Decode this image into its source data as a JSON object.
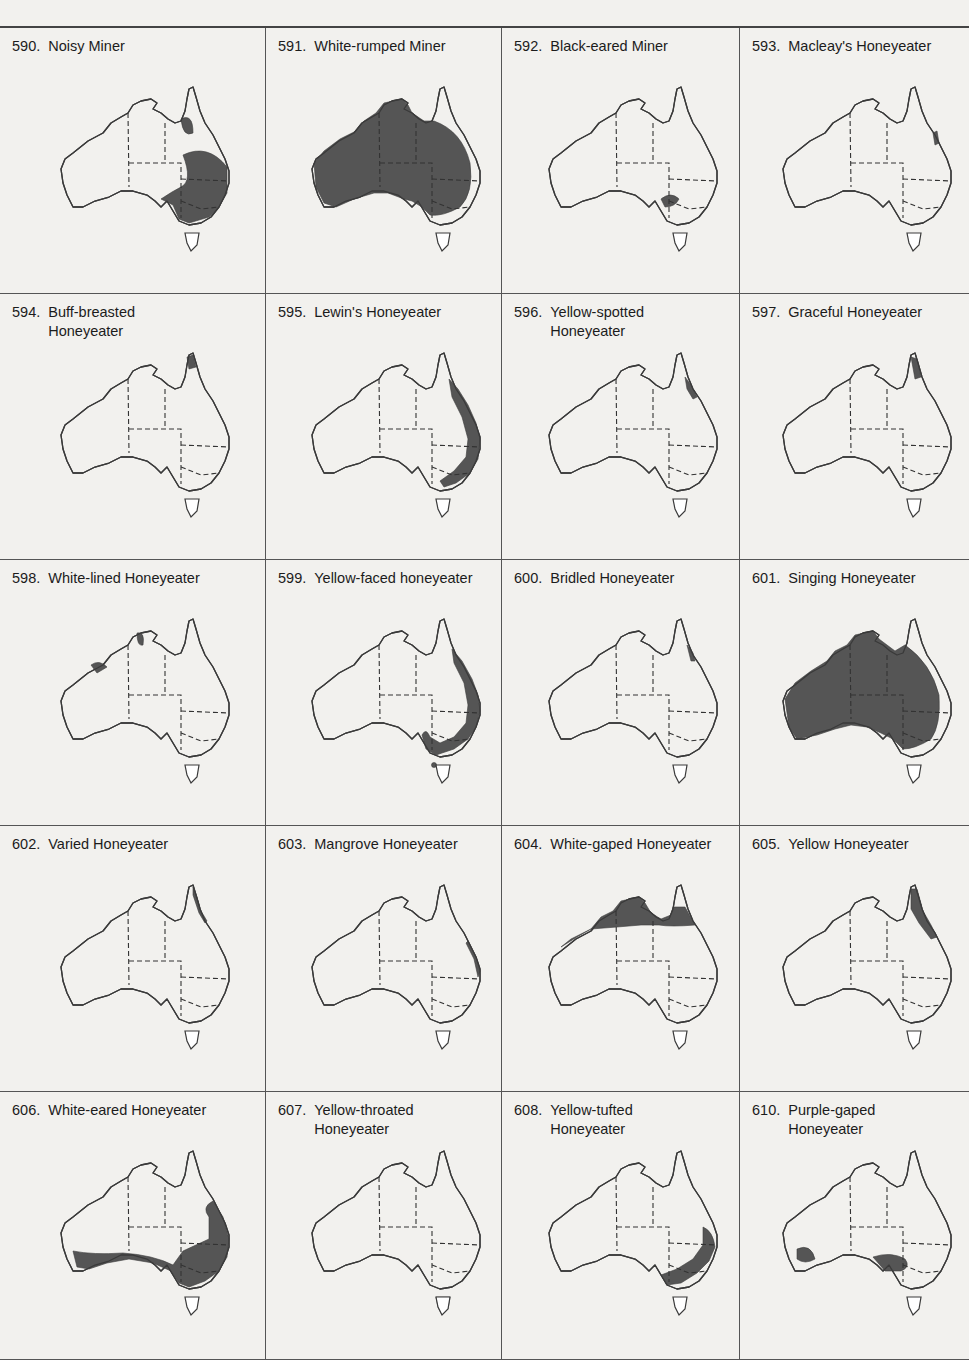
{
  "page": {
    "columns": 4,
    "rows": 5,
    "range_fill_color": "#555555",
    "outline_color": "#3a3a3a",
    "background_color": "#f2f1ee"
  },
  "maps": [
    {
      "number": "590.",
      "name": "Noisy Miner",
      "range": "eastern Australia from Cape York to SE South Australia, plus Tasmania"
    },
    {
      "number": "591.",
      "name": "White-rumped Miner",
      "range": "most of mainland interior excluding east coast and southwest corner"
    },
    {
      "number": "592.",
      "name": "Black-eared Miner",
      "range": "small area in SA/Vic/NSW border region"
    },
    {
      "number": "593.",
      "name": "Macleay's Honeyeater",
      "range": "small area of NE Queensland coast"
    },
    {
      "number": "594.",
      "name": "Buff-breasted\nHoneyeater",
      "range": "tip of Cape York"
    },
    {
      "number": "595.",
      "name": "Lewin's Honeyeater",
      "range": "east coast strip from Queensland to Victoria"
    },
    {
      "number": "596.",
      "name": "Yellow-spotted\nHoneyeater",
      "range": "NE Queensland coast"
    },
    {
      "number": "597.",
      "name": "Graceful Honeyeater",
      "range": "Cape York peninsula"
    },
    {
      "number": "598.",
      "name": "White-lined Honeyeater",
      "range": "Kimberley and Arnhem Land patches"
    },
    {
      "number": "599.",
      "name": "Yellow-faced honeyeater",
      "range": "east coast from Queensland to SE South Australia"
    },
    {
      "number": "600.",
      "name": "Bridled Honeyeater",
      "range": "NE Queensland coast"
    },
    {
      "number": "601.",
      "name": "Singing Honeyeater",
      "range": "most of mainland excluding east coast and Cape York"
    },
    {
      "number": "602.",
      "name": "Varied Honeyeater",
      "range": "NE Queensland coastal strip"
    },
    {
      "number": "603.",
      "name": "Mangrove Honeyeater",
      "range": "east coast mangroves"
    },
    {
      "number": "604.",
      "name": "White-gaped Honeyeater",
      "range": "northern Australia band"
    },
    {
      "number": "605.",
      "name": "Yellow Honeyeater",
      "range": "Cape York to central Queensland coast"
    },
    {
      "number": "606.",
      "name": "White-eared Honeyeater",
      "range": "southern Australia band and eastern inland"
    },
    {
      "number": "607.",
      "name": "Yellow-throated\nHoneyeater",
      "range": "Tasmania"
    },
    {
      "number": "608.",
      "name": "Yellow-tufted\nHoneyeater",
      "range": "SE Australia inland of Great Dividing Range"
    },
    {
      "number": "610.",
      "name": "Purple-gaped\nHoneyeater",
      "range": "SW Western Australia and SA/Vic patches"
    }
  ]
}
